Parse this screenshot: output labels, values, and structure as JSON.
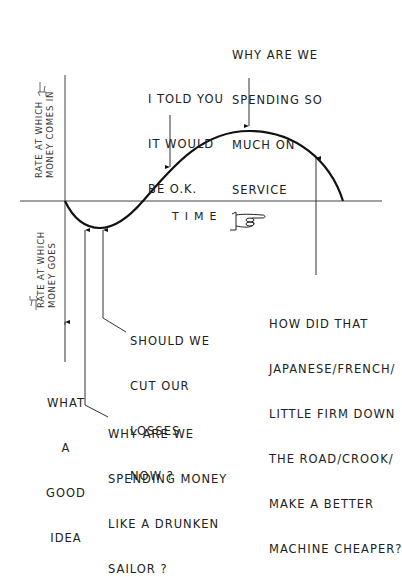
{
  "diagram": {
    "type": "cash-flow-curve",
    "y_axis": {
      "positive_label": [
        "RATE AT WHICH",
        "MONEY COMES IN"
      ],
      "negative_label": [
        "RATE AT WHICH",
        "MONEY GOES"
      ],
      "positive_icon": "pointing-hand-icon",
      "negative_icon": "pointing-hand-icon"
    },
    "x_axis": {
      "label": "TIME",
      "icon": "pointing-hand-icon"
    },
    "annotations": [
      {
        "id": "good-idea",
        "lines": [
          "WHAT",
          "A",
          "GOOD",
          "IDEA"
        ]
      },
      {
        "id": "drunken-sailor",
        "lines": [
          "WHY ARE WE",
          "SPENDING MONEY",
          "LIKE A DRUNKEN",
          "SAILOR ?"
        ]
      },
      {
        "id": "cut-losses",
        "lines": [
          "SHOULD WE",
          "CUT OUR",
          "LOSSES",
          "NOW ?"
        ]
      },
      {
        "id": "told-you",
        "lines": [
          "I TOLD YOU",
          "IT WOULD",
          "BE O.K."
        ]
      },
      {
        "id": "service",
        "lines": [
          "WHY ARE WE",
          "SPENDING SO",
          "MUCH ON",
          "SERVICE"
        ]
      },
      {
        "id": "competitor",
        "lines": [
          "HOW DID THAT",
          "JAPANESE/FRENCH/",
          "LITTLE FIRM DOWN",
          "THE ROAD/CROOK/",
          "MAKE A BETTER",
          "MACHINE CHEAPER?"
        ]
      }
    ]
  }
}
